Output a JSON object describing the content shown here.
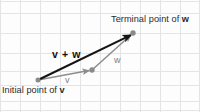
{
  "figure": {
    "background_color": "#fdfdfd",
    "grid": {
      "line_color": "#e3e3e6",
      "spacing_px": 20,
      "visible": true
    },
    "colors": {
      "resultant_vector": "#1a1a1a",
      "component_vector": "#8c8c8c",
      "point_marker": "#8a8a8a",
      "callout_text": "#2b2b2b",
      "vector_label_text": "#7d7d7d"
    },
    "points": [
      {
        "name": "initial-point",
        "x": 38,
        "y": 80
      },
      {
        "name": "intermediate-point",
        "x": 92,
        "y": 70
      },
      {
        "name": "terminal-point",
        "x": 133,
        "y": 33
      }
    ],
    "vectors": [
      {
        "name": "vector-v",
        "label": "v",
        "from": "initial-point",
        "to": "intermediate-point",
        "style": "gray",
        "x1": 38,
        "y1": 80,
        "x2": 90,
        "y2": 70.5
      },
      {
        "name": "vector-w",
        "label": "w",
        "from": "intermediate-point",
        "to": "terminal-point",
        "style": "gray",
        "x1": 92,
        "y1": 70,
        "x2": 131.5,
        "y2": 34.5
      },
      {
        "name": "vector-v-plus-w",
        "label": "v + w",
        "from": "initial-point",
        "to": "terminal-point",
        "style": "black-bold",
        "x1": 38,
        "y1": 80,
        "x2": 131.5,
        "y2": 34.5
      }
    ],
    "labels": {
      "terminal": {
        "prefix": "Terminal point of ",
        "variable": "w"
      },
      "initial": {
        "prefix": "Initial point of ",
        "variable": "v"
      },
      "sum": "v + w",
      "w": "w",
      "v": "v"
    }
  }
}
